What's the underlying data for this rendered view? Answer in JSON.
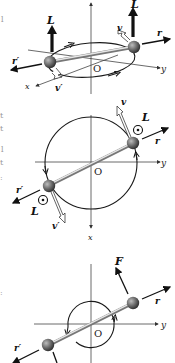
{
  "figure": {
    "colors": {
      "sphere": "#555555",
      "rod": "#c8c8c8",
      "line": "#1a1a1a",
      "axis": "#444444",
      "hollow_arrow": "#ffffff"
    },
    "panels": [
      {
        "id": "top",
        "view": "perspective",
        "labels": {
          "L_left": "L",
          "L_right": "L",
          "v": "v",
          "v_prime": "v′",
          "r": "r",
          "r_prime": "r′",
          "origin": "O",
          "x_axis": "x",
          "y_axis": "y"
        }
      },
      {
        "id": "middle",
        "view": "top-down",
        "labels": {
          "L_right": "L",
          "L_left": "L",
          "v": "v",
          "v_prime": "v′",
          "r": "r",
          "r_prime": "r′",
          "origin": "O",
          "x_axis": "x",
          "y_axis": "y"
        }
      },
      {
        "id": "bottom",
        "view": "top-down",
        "labels": {
          "F": "F",
          "r": "r",
          "r_prime": "r′",
          "origin": "O",
          "y_axis": "y"
        }
      }
    ]
  }
}
